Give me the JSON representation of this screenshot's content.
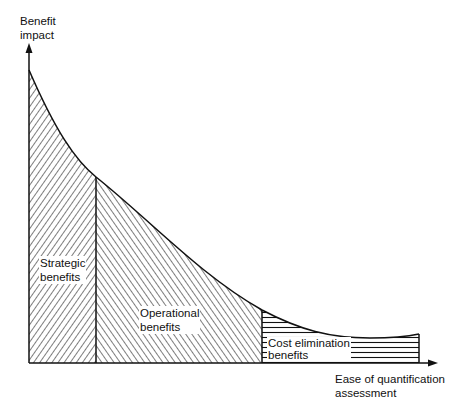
{
  "diagram": {
    "y_axis_label": [
      "Benefit",
      "impact"
    ],
    "x_axis_label": [
      "Ease of quantification",
      "assessment"
    ],
    "regions": [
      {
        "name": "strategic",
        "label": [
          "Strategic",
          "benefits"
        ],
        "hatch": "diagonal-forward"
      },
      {
        "name": "operational",
        "label": [
          "Operational",
          "benefits"
        ],
        "hatch": "diagonal-backward"
      },
      {
        "name": "cost-elimination",
        "label": [
          "Cost elimination",
          "benefits"
        ],
        "hatch": "horizontal"
      }
    ]
  },
  "colors": {
    "ink": "#111111",
    "background": "#ffffff"
  }
}
